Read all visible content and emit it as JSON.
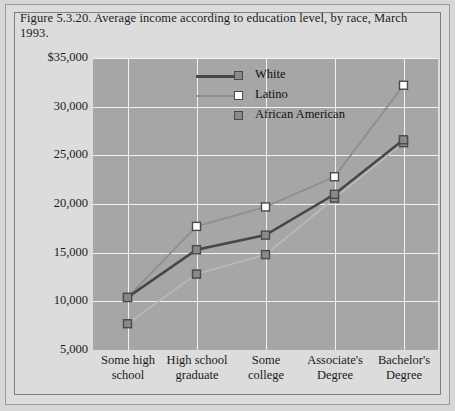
{
  "figure": {
    "title": "Figure 5.3.20. Average income according to education level, by race, March 1993."
  },
  "colors": {
    "page_background": "#d7d7d7",
    "plot_background": "#a6a6a6",
    "gridline": "#f2f2f2",
    "white_series": "#474747",
    "latino_series": "#8f8f8f",
    "african_american_series": "#b8b8b8",
    "marker_edge": "#4a4a4a",
    "marker_fill_gray": "#8a8a8a",
    "marker_fill_white": "#ffffff",
    "text": "#1b1b1b"
  },
  "legend": {
    "position": "top-center-inside",
    "entries": [
      {
        "label": "White",
        "line_color": "#474747",
        "marker_fill": "#8a8a8a",
        "marker_name": "legend-marker-white"
      },
      {
        "label": "Latino",
        "line_color": "#8f8f8f",
        "marker_fill": "#ffffff",
        "marker_name": "legend-marker-latino"
      },
      {
        "label": "African American",
        "line_color": "#bdbdbd",
        "marker_fill": "#8a8a8a",
        "marker_name": "legend-marker-african-american"
      }
    ]
  },
  "axes": {
    "y_ticks": [
      "$35,000",
      "30,000",
      "25,000",
      "20,000",
      "15,000",
      "10,000",
      "5,000"
    ],
    "x_ticks": [
      "Some high\nschool",
      "High school\ngraduate",
      "Some\ncollege",
      "Associate's\nDegree",
      "Bachelor's\nDegree"
    ]
  },
  "chart_data": {
    "type": "line",
    "title": "Figure 5.3.20. Average income according to education level, by race, March 1993.",
    "xlabel": "",
    "ylabel": "",
    "categories": [
      "Some high school",
      "High school graduate",
      "Some college",
      "Associate's Degree",
      "Bachelor's Degree"
    ],
    "series": [
      {
        "name": "White",
        "values": [
          10400,
          15300,
          16800,
          21000,
          26600
        ]
      },
      {
        "name": "Latino",
        "values": [
          10400,
          17700,
          19700,
          22800,
          32200
        ]
      },
      {
        "name": "African American",
        "values": [
          7700,
          12800,
          14800,
          20600,
          26300
        ]
      }
    ],
    "ylim": [
      5000,
      35000
    ],
    "ytick_values": [
      35000,
      30000,
      25000,
      20000,
      15000,
      10000,
      5000
    ],
    "ytick_labels": [
      "$35,000",
      "30,000",
      "25,000",
      "20,000",
      "15,000",
      "10,000",
      "5,000"
    ],
    "grid": true,
    "legend_entries": [
      "White",
      "Latino",
      "African American"
    ],
    "legend_position": "top center (inside plot)",
    "markers": "square"
  }
}
